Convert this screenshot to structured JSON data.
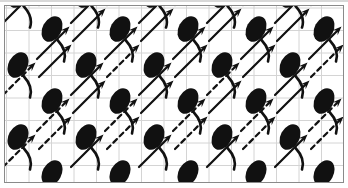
{
  "canvas": {
    "width": 348,
    "height": 188,
    "background_color": "#ffffff",
    "description": "Repeating decorative pattern swatch"
  },
  "frame": {
    "border_color": "#8a8a8a",
    "border_width": 1,
    "margin_x": 4,
    "margin_y": 5,
    "fill_color": "#ffffff"
  },
  "grid": {
    "visible": true,
    "line_color": "#d4d4d4",
    "line_width": 1,
    "cell_size": 22.5,
    "origin_x": 1.5,
    "origin_y": 2.0
  },
  "motifs": {
    "ink_color": "#111111",
    "tadpole": {
      "name": "tadpole-motif",
      "head_rx": 9.5,
      "head_ry": 13.5,
      "head_rotation_deg": 28,
      "tail_stroke_width": 2.6,
      "tail_description": "curved tail sweeping down and right from base of ellipse"
    },
    "arrow": {
      "name": "arrow-motif",
      "direction_deg": -45,
      "length": 46,
      "stroke_width": 2.2,
      "head_length": 9,
      "head_width": 7,
      "dash_pattern": "5 4"
    }
  },
  "lattice": {
    "period_x": 68,
    "period_y": 47,
    "row_offset_x": 34,
    "columns": 7,
    "rows": 6
  },
  "tadpole_instances": [
    {
      "x": 17,
      "y": -6,
      "scale": 1.0,
      "rot": 0
    },
    {
      "x": 85,
      "y": -6,
      "scale": 1.0,
      "rot": 0
    },
    {
      "x": 153,
      "y": -6,
      "scale": 1.0,
      "rot": 0
    },
    {
      "x": 221,
      "y": -6,
      "scale": 1.0,
      "rot": 0
    },
    {
      "x": 289,
      "y": -6,
      "scale": 1.0,
      "rot": 0
    },
    {
      "x": 51,
      "y": 28,
      "scale": 1.0,
      "rot": 0
    },
    {
      "x": 119,
      "y": 28,
      "scale": 1.0,
      "rot": 0
    },
    {
      "x": 187,
      "y": 28,
      "scale": 1.0,
      "rot": 0
    },
    {
      "x": 255,
      "y": 28,
      "scale": 1.0,
      "rot": 0
    },
    {
      "x": 323,
      "y": 28,
      "scale": 1.0,
      "rot": 0
    },
    {
      "x": 17,
      "y": 64,
      "scale": 1.0,
      "rot": 0
    },
    {
      "x": 85,
      "y": 64,
      "scale": 1.0,
      "rot": 0
    },
    {
      "x": 153,
      "y": 64,
      "scale": 1.0,
      "rot": 0
    },
    {
      "x": 221,
      "y": 64,
      "scale": 1.0,
      "rot": 0
    },
    {
      "x": 289,
      "y": 64,
      "scale": 1.0,
      "rot": 0
    },
    {
      "x": -15,
      "y": 64,
      "scale": 1.0,
      "rot": 0
    },
    {
      "x": 51,
      "y": 100,
      "scale": 1.0,
      "rot": 0
    },
    {
      "x": 119,
      "y": 100,
      "scale": 1.0,
      "rot": 0
    },
    {
      "x": 187,
      "y": 100,
      "scale": 1.0,
      "rot": 0
    },
    {
      "x": 255,
      "y": 100,
      "scale": 1.0,
      "rot": 0
    },
    {
      "x": 323,
      "y": 100,
      "scale": 1.0,
      "rot": 0
    },
    {
      "x": 17,
      "y": 136,
      "scale": 1.0,
      "rot": 0
    },
    {
      "x": 85,
      "y": 136,
      "scale": 1.0,
      "rot": 0
    },
    {
      "x": 153,
      "y": 136,
      "scale": 1.0,
      "rot": 0
    },
    {
      "x": 221,
      "y": 136,
      "scale": 1.0,
      "rot": 0
    },
    {
      "x": 289,
      "y": 136,
      "scale": 1.0,
      "rot": 0
    },
    {
      "x": -15,
      "y": 136,
      "scale": 1.0,
      "rot": 0
    },
    {
      "x": 51,
      "y": 172,
      "scale": 1.0,
      "rot": 0
    },
    {
      "x": 119,
      "y": 172,
      "scale": 1.0,
      "rot": 0
    },
    {
      "x": 187,
      "y": 172,
      "scale": 1.0,
      "rot": 0
    },
    {
      "x": 255,
      "y": 172,
      "scale": 1.0,
      "rot": 0
    },
    {
      "x": 323,
      "y": 172,
      "scale": 1.0,
      "rot": 0
    }
  ],
  "arrow_instances": [
    {
      "x": 2,
      "y": 22,
      "style": "solid"
    },
    {
      "x": 38,
      "y": 4,
      "style": "solid"
    },
    {
      "x": 70,
      "y": 22,
      "style": "solid"
    },
    {
      "x": 106,
      "y": 4,
      "style": "solid"
    },
    {
      "x": 138,
      "y": 22,
      "style": "solid"
    },
    {
      "x": 174,
      "y": 4,
      "style": "solid"
    },
    {
      "x": 206,
      "y": 22,
      "style": "solid"
    },
    {
      "x": 242,
      "y": 4,
      "style": "solid"
    },
    {
      "x": 274,
      "y": 22,
      "style": "solid"
    },
    {
      "x": 310,
      "y": 4,
      "style": "solid"
    },
    {
      "x": 36,
      "y": 58,
      "style": "solid"
    },
    {
      "x": 72,
      "y": 40,
      "style": "solid"
    },
    {
      "x": 104,
      "y": 58,
      "style": "solid"
    },
    {
      "x": 140,
      "y": 40,
      "style": "solid"
    },
    {
      "x": 172,
      "y": 58,
      "style": "solid"
    },
    {
      "x": 208,
      "y": 40,
      "style": "solid"
    },
    {
      "x": 240,
      "y": 58,
      "style": "solid"
    },
    {
      "x": 276,
      "y": 40,
      "style": "solid"
    },
    {
      "x": 308,
      "y": 58,
      "style": "solid"
    },
    {
      "x": 2,
      "y": 94,
      "style": "dashed"
    },
    {
      "x": 38,
      "y": 76,
      "style": "solid"
    },
    {
      "x": 70,
      "y": 94,
      "style": "solid"
    },
    {
      "x": 106,
      "y": 76,
      "style": "dashed"
    },
    {
      "x": 138,
      "y": 94,
      "style": "solid"
    },
    {
      "x": 174,
      "y": 76,
      "style": "solid"
    },
    {
      "x": 206,
      "y": 94,
      "style": "dashed"
    },
    {
      "x": 242,
      "y": 76,
      "style": "solid"
    },
    {
      "x": 274,
      "y": 94,
      "style": "solid"
    },
    {
      "x": 310,
      "y": 76,
      "style": "dashed"
    },
    {
      "x": 36,
      "y": 130,
      "style": "dashed"
    },
    {
      "x": 72,
      "y": 112,
      "style": "solid"
    },
    {
      "x": 104,
      "y": 130,
      "style": "dashed"
    },
    {
      "x": 140,
      "y": 112,
      "style": "solid"
    },
    {
      "x": 172,
      "y": 130,
      "style": "dashed"
    },
    {
      "x": 208,
      "y": 112,
      "style": "solid"
    },
    {
      "x": 240,
      "y": 130,
      "style": "dashed"
    },
    {
      "x": 276,
      "y": 112,
      "style": "solid"
    },
    {
      "x": 308,
      "y": 130,
      "style": "dashed"
    },
    {
      "x": 2,
      "y": 166,
      "style": "dashed"
    },
    {
      "x": 38,
      "y": 148,
      "style": "dashed"
    },
    {
      "x": 70,
      "y": 166,
      "style": "solid"
    },
    {
      "x": 106,
      "y": 148,
      "style": "dashed"
    },
    {
      "x": 138,
      "y": 166,
      "style": "solid"
    },
    {
      "x": 174,
      "y": 148,
      "style": "dashed"
    },
    {
      "x": 206,
      "y": 166,
      "style": "solid"
    },
    {
      "x": 242,
      "y": 148,
      "style": "dashed"
    },
    {
      "x": 274,
      "y": 166,
      "style": "solid"
    },
    {
      "x": 310,
      "y": 148,
      "style": "dashed"
    }
  ]
}
